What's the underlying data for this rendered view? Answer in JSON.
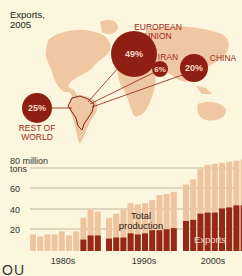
{
  "map": {
    "title_line1": "Exports,",
    "title_line2": "2005",
    "origin": "Brazil",
    "destinations": [
      {
        "name_line1": "EUROPEAN",
        "name_line2": "UNION",
        "percent": "49%",
        "value": 49
      },
      {
        "name_line1": "IRAN",
        "name_line2": "",
        "percent": "6%",
        "value": 6
      },
      {
        "name_line1": "CHINA",
        "name_line2": "",
        "percent": "20%",
        "value": 20
      },
      {
        "name_line1": "REST OF",
        "name_line2": "WORLD",
        "percent": "25%",
        "value": 25
      }
    ]
  },
  "colors": {
    "background": "#fbf6dd",
    "land": "#efc7a2",
    "circle": "#8e1f12",
    "exports_bar": "#962816",
    "production_bar": "#efc4a0",
    "gridline": "#9b8f7a"
  },
  "chart": {
    "y_unit_line1": "80 million",
    "y_unit_line2": "tons",
    "y_ticks": [
      "60",
      "40",
      "20"
    ],
    "decades": [
      "1980s",
      "1990s",
      "2000s"
    ],
    "label_total": [
      "Total",
      "production"
    ],
    "label_exports": "Exports"
  },
  "chart_data": {
    "type": "bar",
    "xlabel": "",
    "ylabel": "million tons",
    "ylim": [
      0,
      80
    ],
    "grid": true,
    "y_ticks": [
      20,
      40,
      60,
      80
    ],
    "categories": [
      "1980",
      "1981",
      "1982",
      "1983",
      "1984",
      "1985",
      "1986",
      "1987",
      "1988",
      "1989",
      "1990",
      "1991",
      "1992",
      "1993",
      "1994",
      "1995",
      "1996",
      "1997",
      "1998",
      "1999",
      "2000",
      "2001",
      "2002",
      "2003",
      "2004",
      "2005",
      "2006",
      "2007",
      "2008"
    ],
    "x_group_labels": [
      "1980s",
      "1990s",
      "2000s"
    ],
    "series": [
      {
        "name": "Total production",
        "values": [
          16,
          14,
          16,
          16,
          19,
          15,
          19,
          32,
          40,
          38,
          32,
          36,
          40,
          46,
          45,
          46,
          49,
          54,
          55,
          57,
          64,
          69,
          79,
          83,
          84,
          85,
          86,
          87,
          88
        ]
      },
      {
        "name": "Exports",
        "values": [
          0,
          0,
          0,
          0,
          0,
          0,
          0,
          11,
          15,
          15,
          12,
          13,
          13,
          17,
          16,
          17,
          20,
          20,
          21,
          22,
          29,
          30,
          36,
          37,
          37,
          41,
          42,
          44,
          44
        ]
      }
    ],
    "annotations": [
      "Total production",
      "Exports"
    ],
    "legend_position": "inline",
    "pie_inset": {
      "type": "bubble-map",
      "title": "Exports, 2005",
      "categories": [
        "European Union",
        "Iran",
        "China",
        "Rest of World"
      ],
      "values": [
        49,
        6,
        20,
        25
      ]
    }
  },
  "footer": {
    "fragment": "OU"
  }
}
